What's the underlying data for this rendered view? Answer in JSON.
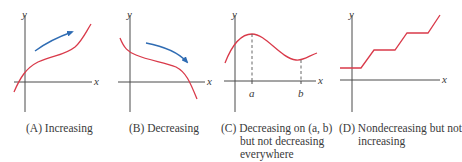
{
  "colors": {
    "axis": "#4a4a4a",
    "curve": "#d93a4a",
    "arrow": "#2f6cb3",
    "dashed": "#555555",
    "text": "#3a3a3a"
  },
  "panels": [
    {
      "id": "A",
      "axis_labels": {
        "x": "x",
        "y": "y"
      },
      "caption": {
        "lines": [
          "(A) Increasing"
        ]
      }
    },
    {
      "id": "B",
      "axis_labels": {
        "x": "x",
        "y": "y"
      },
      "caption": {
        "lines": [
          "(B) Decreasing"
        ]
      }
    },
    {
      "id": "C",
      "axis_labels": {
        "x": "x",
        "y": "y"
      },
      "tick_labels": [
        "a",
        "b"
      ],
      "caption": {
        "lines": [
          "(C) Decreasing on (a, b)",
          "but not decreasing",
          "everywhere"
        ]
      }
    },
    {
      "id": "D",
      "axis_labels": {
        "x": "x",
        "y": "y"
      },
      "caption": {
        "lines": [
          "(D) Nondecreasing but not",
          "increasing"
        ]
      }
    }
  ]
}
